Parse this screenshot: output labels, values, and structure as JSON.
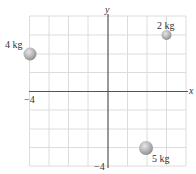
{
  "diagram": {
    "type": "coordinate-grid-with-masses",
    "axes": {
      "x_label": "x",
      "y_label": "y",
      "x_range": [
        -4,
        4
      ],
      "y_range": [
        -4,
        4
      ],
      "x_min_tick_label": "−4",
      "y_min_tick_label": "−4",
      "grid_step": 1
    },
    "masses": [
      {
        "label": "4 kg",
        "mass": 4,
        "x": -4,
        "y": 2
      },
      {
        "label": "2 kg",
        "mass": 2,
        "x": 3,
        "y": 3
      },
      {
        "label": "5 kg",
        "mass": 5,
        "x": 2,
        "y": -3
      }
    ],
    "colors": {
      "grid": "#dcdcdc",
      "axis": "#555555",
      "ball": "#b8b8b8"
    }
  }
}
